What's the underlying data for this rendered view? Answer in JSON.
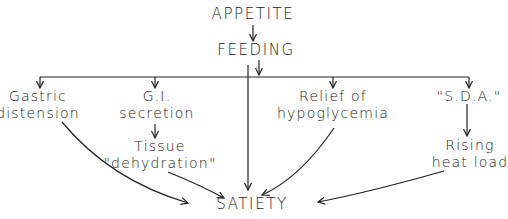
{
  "diagram": {
    "top": "APPETITE",
    "middle": "FEEDING",
    "bottom": "SATIETY",
    "branches": [
      {
        "lines": [
          "Gastric",
          "distension"
        ]
      },
      {
        "lines": [
          "G.I.",
          "secretion"
        ],
        "sub": [
          "Tissue",
          "\"dehydration\""
        ]
      },
      {
        "lines": [
          "Relief of",
          "hypoglycemia"
        ]
      },
      {
        "lines": [
          "\"S.D.A.\""
        ],
        "sub": [
          "Rising",
          "heat load"
        ]
      }
    ]
  },
  "colors": {
    "ink": "#222222",
    "background": "#ffffff"
  }
}
